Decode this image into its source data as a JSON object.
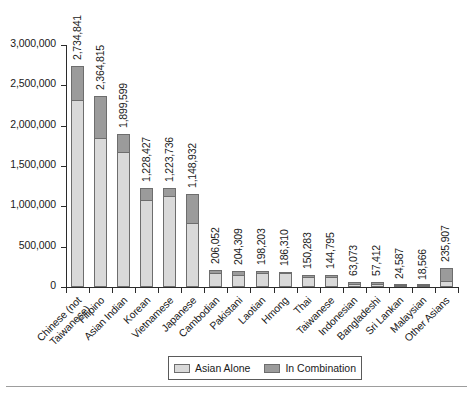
{
  "chart_data": {
    "type": "bar",
    "subtype": "stacked-vertical",
    "title": "",
    "subtitle": "",
    "xlabel": "",
    "ylabel": "",
    "ylim": [
      0,
      3000000
    ],
    "grid": false,
    "legend_position": "bottom-center",
    "ytick_labels": [
      "3,000,000",
      "2,500,000",
      "2,000,000",
      "1,500,000",
      "1,000,000",
      "500,000",
      "0"
    ],
    "ytick_values": [
      3000000,
      2500000,
      2000000,
      1500000,
      1000000,
      500000,
      0
    ],
    "categories": [
      "Chinese (not Taiwanese)",
      "Filipino",
      "Asian Indian",
      "Korean",
      "Vietnamese",
      "Japanese",
      "Cambodian",
      "Pakistani",
      "Laotian",
      "Hmong",
      "Thai",
      "Taiwanese",
      "Indonesian",
      "Bangladeshi",
      "Sri Lankan",
      "Malaysian",
      "Other Asians"
    ],
    "category_label_lines": [
      [
        "Chinese (not",
        "Taiwanese)"
      ],
      [
        "Filipino"
      ],
      [
        "Asian Indian"
      ],
      [
        "Korean"
      ],
      [
        "Vietnamese"
      ],
      [
        "Japanese"
      ],
      [
        "Cambodian"
      ],
      [
        "Pakistani"
      ],
      [
        "Laotian"
      ],
      [
        "Hmong"
      ],
      [
        "Thai"
      ],
      [
        "Taiwanese"
      ],
      [
        "Indonesian"
      ],
      [
        "Bangladeshi"
      ],
      [
        "Sri Lankan"
      ],
      [
        "Malaysian"
      ],
      [
        "Other Asians"
      ]
    ],
    "series": [
      {
        "name": "Asian Alone",
        "color": "#d9d9d9",
        "values": [
          2314537,
          1850314,
          1678765,
          1076872,
          1122528,
          796700,
          171937,
          153533,
          168707,
          169428,
          120918,
          118048,
          39757,
          41280,
          20145,
          15029,
          70224
        ]
      },
      {
        "name": "In Combination",
        "color": "#9b9b9b",
        "values": [
          420304,
          514501,
          220834,
          151555,
          101208,
          352232,
          34115,
          50776,
          29496,
          16882,
          29365,
          26747,
          23316,
          16132,
          4442,
          3537,
          165683
        ]
      }
    ],
    "totals": [
      2734841,
      2364815,
      1899599,
      1228427,
      1223736,
      1148932,
      206052,
      204309,
      198203,
      186310,
      150283,
      144795,
      63073,
      57412,
      24587,
      18566,
      235907
    ],
    "total_labels": [
      "2,734,841",
      "2,364,815",
      "1,899,599",
      "1,228,427",
      "1,223,736",
      "1,148,932",
      "206,052",
      "204,309",
      "198,203",
      "186,310",
      "150,283",
      "144,795",
      "63,073",
      "57,412",
      "24,587",
      "18,566",
      "235,907"
    ],
    "legend": [
      {
        "label": "Asian Alone",
        "color": "#d9d9d9"
      },
      {
        "label": "In Combination",
        "color": "#9b9b9b"
      }
    ]
  },
  "legend": {
    "asian_alone": "Asian Alone",
    "in_combination": "In Combination"
  }
}
